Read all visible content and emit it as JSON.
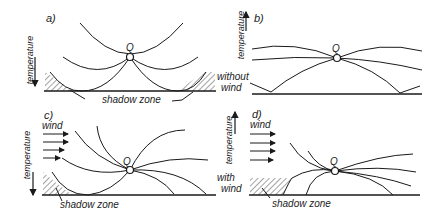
{
  "figure": {
    "panels": [
      {
        "id": "a",
        "label": "a)",
        "axis_label": "temperature",
        "axis_direction": "down",
        "source_label": "Q",
        "shadow_label": "shadow zone",
        "condition_label": "without wind"
      },
      {
        "id": "b",
        "label": "b)",
        "axis_label": "temperature",
        "axis_direction": "up",
        "source_label": "Q"
      },
      {
        "id": "c",
        "label": "c)",
        "axis_label": "temperature",
        "axis_direction": "down",
        "source_label": "Q",
        "wind_label": "wind",
        "shadow_label": "shadow zone"
      },
      {
        "id": "d",
        "label": "d)",
        "axis_label": "temperature",
        "axis_direction": "up",
        "source_label": "Q",
        "wind_label": "wind",
        "shadow_label": "shadow zone",
        "condition_label": "with wind"
      }
    ],
    "row_labels": {
      "top_left": "without",
      "top_right": "wind",
      "bottom_left": "with",
      "bottom_right": "wind"
    }
  }
}
